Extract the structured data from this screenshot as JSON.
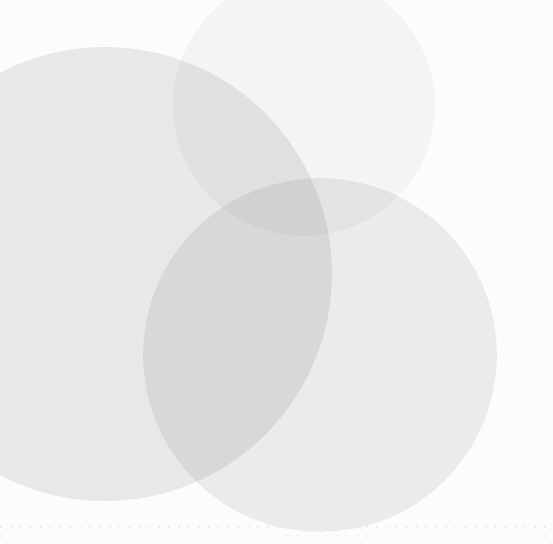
{
  "canvas": {
    "width": 553,
    "height": 544,
    "background_color": "#fcfcfc",
    "description": "Abstract decorative background of overlapping translucent light-grey circles on a near-white field"
  },
  "palette": {
    "background": "#fcfcfc",
    "circle_light": "#ebebeb",
    "circle_medium": "#eeeeee",
    "circle_faint": "#f7f7f7",
    "overlap_darkest": "#d2d2d2",
    "dot_color": "#e9e9e9"
  },
  "shapes": [
    {
      "name": "large-left-circle",
      "shape": "circle",
      "fill": "#ebebeb",
      "center_x": 105,
      "center_y": 274,
      "radius": 227
    },
    {
      "name": "medium-right-circle",
      "shape": "circle",
      "fill": "#eeeeee",
      "center_x": 320,
      "center_y": 355,
      "radius": 177
    },
    {
      "name": "faint-top-circle",
      "shape": "circle",
      "fill": "#f7f7f7",
      "center_x": 304,
      "center_y": 105,
      "radius": 131
    }
  ],
  "dot_rows": [
    {
      "name": "upper-dot-row",
      "y": 526,
      "spacing": 9.9,
      "color": "#e9e9e9"
    },
    {
      "name": "lower-dot-row",
      "y": 535,
      "spacing": 9.9,
      "color": "#e9e9e9"
    }
  ]
}
